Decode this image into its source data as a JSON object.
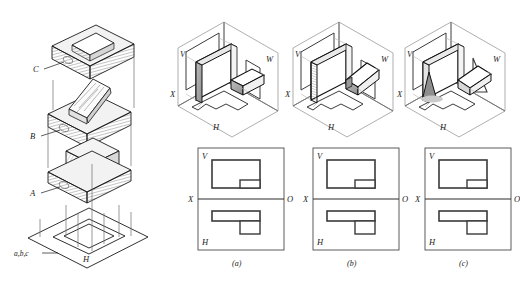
{
  "figure": {
    "type": "technical-drawing",
    "background_color": "#ffffff",
    "line_color": "#1a1a1a",
    "hatch_color": "#808080",
    "shade_color": "#a8a8a8"
  },
  "left_column": {
    "description": "Exploded isometric sequence of solids dropped onto the horizontal plane H",
    "solids": [
      {
        "id": "C",
        "label": "C",
        "shape": "rectangular slab with rectangular through cavity"
      },
      {
        "id": "B",
        "label": "B",
        "shape": "slab with inclined wedge / folded plate on top"
      },
      {
        "id": "A",
        "label": "A",
        "shape": "slab with rectangular block on top"
      }
    ],
    "plane": {
      "label": "H",
      "projections_label": "a,b,c"
    }
  },
  "cases": [
    {
      "key": "a",
      "caption": "(a)",
      "iso": {
        "planes": [
          {
            "name": "V",
            "label": "V"
          },
          {
            "name": "W",
            "label": "W"
          },
          {
            "name": "H",
            "label": "H"
          }
        ],
        "axis_label": "X",
        "solid": "vertical rectangular plate with horizontal rectangular bar"
      },
      "ortho": {
        "quadrant_top_label": "V",
        "quadrant_bottom_label": "H",
        "axis_left_label": "X",
        "axis_right_label": "O",
        "v_view": {
          "shape": "large rectangle with small notch rectangle at lower right"
        },
        "h_view": {
          "shape": "wide thin rectangle with small square dropping below at right"
        }
      }
    },
    {
      "key": "b",
      "caption": "(b)",
      "iso": {
        "planes": [
          {
            "name": "V",
            "label": "V"
          },
          {
            "name": "W",
            "label": "W"
          },
          {
            "name": "H",
            "label": "H"
          }
        ],
        "axis_label": "X",
        "solid": "vertical rectangular plate with inclined wedge bar"
      },
      "ortho": {
        "quadrant_top_label": "V",
        "quadrant_bottom_label": "H",
        "axis_left_label": "X",
        "axis_right_label": "O",
        "v_view": {
          "shape": "large rectangle with small notch rectangle at lower right"
        },
        "h_view": {
          "shape": "wide thin rectangle with small square dropping below at right"
        }
      }
    },
    {
      "key": "c",
      "caption": "(c)",
      "iso": {
        "planes": [
          {
            "name": "V",
            "label": "V"
          },
          {
            "name": "W",
            "label": "W"
          },
          {
            "name": "H",
            "label": "H"
          }
        ],
        "axis_label": "X",
        "solid": "vertical plate with triangular gusset and tilted plate"
      },
      "ortho": {
        "quadrant_top_label": "V",
        "quadrant_bottom_label": "H",
        "axis_left_label": "X",
        "axis_right_label": "O",
        "v_view": {
          "shape": "large rectangle with small notch rectangle at lower right"
        },
        "h_view": {
          "shape": "wide thin rectangle with small square dropping below at right"
        }
      }
    }
  ]
}
